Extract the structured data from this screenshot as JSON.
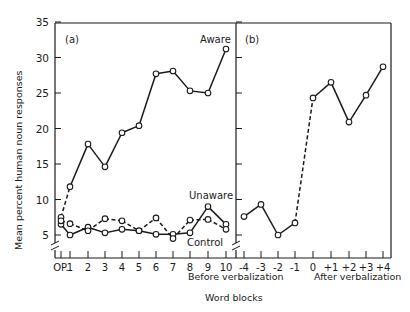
{
  "chart_data": {
    "type": "line",
    "ylabel": "Mean percent human noun responses",
    "xlabel": "Word blocks",
    "ylim": [
      3,
      35
    ],
    "yticks": [
      5,
      10,
      15,
      20,
      25,
      30,
      35
    ],
    "grid": false,
    "panels": [
      {
        "label": "(a)",
        "categories": [
          "OP",
          "1",
          "2",
          "3",
          "4",
          "5",
          "6",
          "7",
          "8",
          "9",
          "10"
        ],
        "series": [
          {
            "name": "Aware",
            "style": "solid",
            "values": [
              7.5,
              11.8,
              17.8,
              14.6,
              19.4,
              20.4,
              27.7,
              28.1,
              25.3,
              25.0,
              31.2
            ],
            "first_segment_dashed": true
          },
          {
            "name": "Unaware",
            "style": "solid",
            "values": [
              6.5,
              5.0,
              6.1,
              5.3,
              5.8,
              5.6,
              5.1,
              5.1,
              5.3,
              9.0,
              6.5
            ]
          },
          {
            "name": "Control",
            "style": "dashed",
            "values": [
              7.0,
              6.6,
              5.6,
              7.3,
              7.0,
              5.6,
              7.4,
              4.5,
              7.1,
              7.2,
              5.8
            ]
          }
        ]
      },
      {
        "label": "(b)",
        "categories": [
          "-4",
          "-3",
          "-2",
          "-1",
          "0",
          "+1",
          "+2",
          "+3",
          "+4"
        ],
        "group_labels": [
          "Before verbalization",
          "After verbalization"
        ],
        "series": [
          {
            "name": "Aware (relative to verbalization)",
            "values": [
              7.6,
              9.3,
              5.0,
              6.7,
              24.3,
              26.5,
              20.9,
              24.7,
              28.7
            ],
            "dashed_segment": [
              3,
              4
            ]
          }
        ]
      }
    ]
  },
  "labels": {
    "panel_a": "(a)",
    "panel_b": "(b)",
    "aware": "Aware",
    "unaware": "Unaware",
    "control": "Control",
    "before": "Before verbalization",
    "after": "After verbalization",
    "xlabel": "Word blocks",
    "ylabel": "Mean percent human noun responses"
  }
}
